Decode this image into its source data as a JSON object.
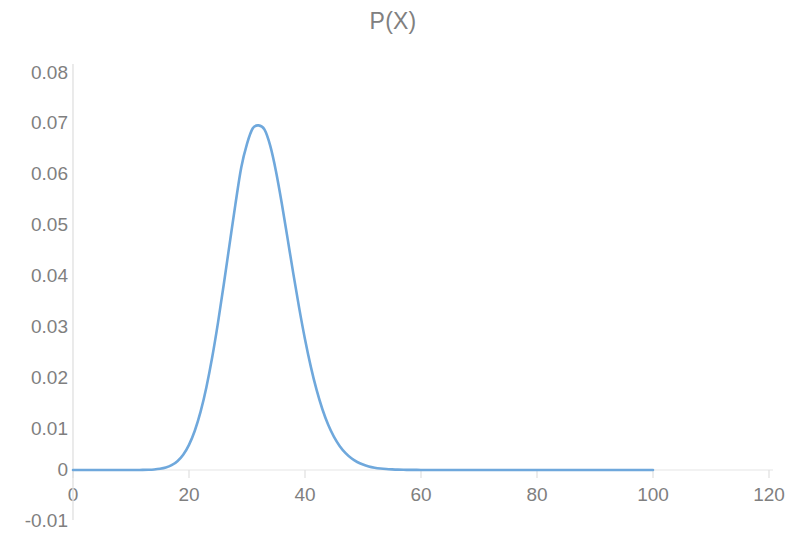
{
  "chart_data": {
    "type": "line",
    "title": "P(X)",
    "xlabel": "",
    "ylabel": "",
    "xlim": [
      0,
      120
    ],
    "ylim": [
      -0.01,
      0.08
    ],
    "x_ticks": [
      0,
      20,
      40,
      60,
      80,
      100,
      120
    ],
    "x_tick_labels": [
      "0",
      "20",
      "40",
      "60",
      "80",
      "100",
      "120"
    ],
    "y_ticks": [
      -0.01,
      0,
      0.01,
      0.02,
      0.03,
      0.04,
      0.05,
      0.06,
      0.07,
      0.08
    ],
    "y_tick_labels": [
      "0.08",
      "0.07",
      "0.06",
      "0.05",
      "0.04",
      "0.03",
      "0.02",
      "0.01",
      "0",
      "-0.01"
    ],
    "grid": false,
    "legend": "none",
    "line_color": "#6FA8DC",
    "line_width": 2.6,
    "series": [
      {
        "name": "P(X)",
        "x": [
          0,
          1,
          2,
          3,
          4,
          5,
          6,
          7,
          8,
          9,
          10,
          11,
          12,
          13,
          14,
          15,
          16,
          17,
          18,
          19,
          20,
          21,
          22,
          23,
          24,
          25,
          26,
          27,
          28,
          29,
          30,
          31,
          32,
          33,
          34,
          35,
          36,
          37,
          38,
          39,
          40,
          41,
          42,
          43,
          44,
          45,
          46,
          47,
          48,
          49,
          50,
          51,
          52,
          53,
          54,
          55,
          56,
          57,
          58,
          59,
          60,
          62,
          64,
          66,
          68,
          70,
          75,
          80,
          85,
          90,
          95,
          100
        ],
        "values": [
          0.0,
          0.0,
          0.0,
          0.0,
          0.0,
          0.0,
          0.0,
          0.0,
          0.0,
          0.0,
          0.0,
          1e-05,
          2e-05,
          5e-05,
          0.00011,
          0.00024,
          0.00049,
          0.00096,
          0.00177,
          0.00307,
          0.00506,
          0.00789,
          0.01172,
          0.01664,
          0.02265,
          0.02963,
          0.03734,
          0.04541,
          0.05339,
          0.06076,
          0.06556,
          0.06869,
          0.06927,
          0.06845,
          0.06519,
          0.06002,
          0.05358,
          0.04651,
          0.03937,
          0.03254,
          0.02629,
          0.02078,
          0.01609,
          0.01221,
          0.00909,
          0.00665,
          0.00478,
          0.00338,
          0.00235,
          0.00161,
          0.00109,
          0.00072,
          0.00047,
          0.0003,
          0.00019,
          0.00012,
          7e-05,
          4e-05,
          3e-05,
          2e-05,
          1e-05,
          0.0,
          0.0,
          0.0,
          0.0,
          0.0,
          0.0,
          0.0,
          0.0,
          0.0,
          0.0,
          0.0
        ],
        "peak_x": 32,
        "peak_y": 0.0693
      }
    ]
  },
  "axis": {
    "y_axis_color": "#d9d9d9",
    "x_axis_color": "#d9d9d9",
    "tick_text_color": "#7f7f7f"
  }
}
